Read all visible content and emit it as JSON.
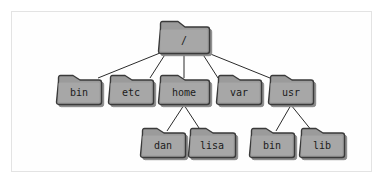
{
  "diagram": {
    "type": "tree",
    "background_color": "#ffffff",
    "frame_border_color": "#e3e3e3",
    "folder_fill_color": "#9b9b9b",
    "folder_highlight_color": "#b0b0b0",
    "folder_outline_color": "#3a3a3a",
    "shadow_color": "#8a8a8a",
    "label_color": "#1b1b1b",
    "edge_color": "#2b2b2b",
    "nodes": [
      {
        "id": "root",
        "label": "/",
        "x": 158,
        "y": 21,
        "w": 52,
        "h": 33,
        "level": 0,
        "parent": null
      },
      {
        "id": "bin",
        "label": "bin",
        "x": 56,
        "y": 75,
        "w": 46,
        "h": 30,
        "level": 1,
        "parent": "root"
      },
      {
        "id": "etc",
        "label": "etc",
        "x": 108,
        "y": 75,
        "w": 46,
        "h": 30,
        "level": 1,
        "parent": "root"
      },
      {
        "id": "home",
        "label": "home",
        "x": 158,
        "y": 75,
        "w": 52,
        "h": 30,
        "level": 1,
        "parent": "root"
      },
      {
        "id": "var",
        "label": "var",
        "x": 216,
        "y": 75,
        "w": 46,
        "h": 30,
        "level": 1,
        "parent": "root"
      },
      {
        "id": "usr",
        "label": "usr",
        "x": 268,
        "y": 75,
        "w": 46,
        "h": 30,
        "level": 1,
        "parent": "root"
      },
      {
        "id": "dan",
        "label": "dan",
        "x": 140,
        "y": 128,
        "w": 46,
        "h": 30,
        "level": 2,
        "parent": "home"
      },
      {
        "id": "lisa",
        "label": "lisa",
        "x": 188,
        "y": 128,
        "w": 48,
        "h": 30,
        "level": 2,
        "parent": "home"
      },
      {
        "id": "usr-bin",
        "label": "bin",
        "x": 249,
        "y": 128,
        "w": 46,
        "h": 30,
        "level": 2,
        "parent": "usr"
      },
      {
        "id": "usr-lib",
        "label": "lib",
        "x": 299,
        "y": 128,
        "w": 46,
        "h": 30,
        "level": 2,
        "parent": "usr"
      }
    ],
    "edges": [
      {
        "id": "edge-root-bin",
        "from": "root",
        "to": "bin",
        "x1": 160,
        "y1": 53,
        "x2": 98,
        "y2": 78
      },
      {
        "id": "edge-root-etc",
        "from": "root",
        "to": "etc",
        "x1": 166,
        "y1": 53,
        "x2": 150,
        "y2": 78
      },
      {
        "id": "edge-root-home",
        "from": "root",
        "to": "home",
        "x1": 184,
        "y1": 53,
        "x2": 184,
        "y2": 78
      },
      {
        "id": "edge-root-var",
        "from": "root",
        "to": "var",
        "x1": 202,
        "y1": 53,
        "x2": 218,
        "y2": 78
      },
      {
        "id": "edge-root-usr",
        "from": "root",
        "to": "usr",
        "x1": 208,
        "y1": 53,
        "x2": 270,
        "y2": 78
      },
      {
        "id": "edge-home-dan",
        "from": "home",
        "to": "dan",
        "x1": 184,
        "y1": 105,
        "x2": 167,
        "y2": 131
      },
      {
        "id": "edge-home-lisa",
        "from": "home",
        "to": "lisa",
        "x1": 184,
        "y1": 105,
        "x2": 201,
        "y2": 131
      },
      {
        "id": "edge-usr-bin",
        "from": "usr",
        "to": "usr-bin",
        "x1": 291,
        "y1": 105,
        "x2": 276,
        "y2": 131
      },
      {
        "id": "edge-usr-lib",
        "from": "usr",
        "to": "usr-lib",
        "x1": 291,
        "y1": 105,
        "x2": 312,
        "y2": 131
      }
    ]
  }
}
